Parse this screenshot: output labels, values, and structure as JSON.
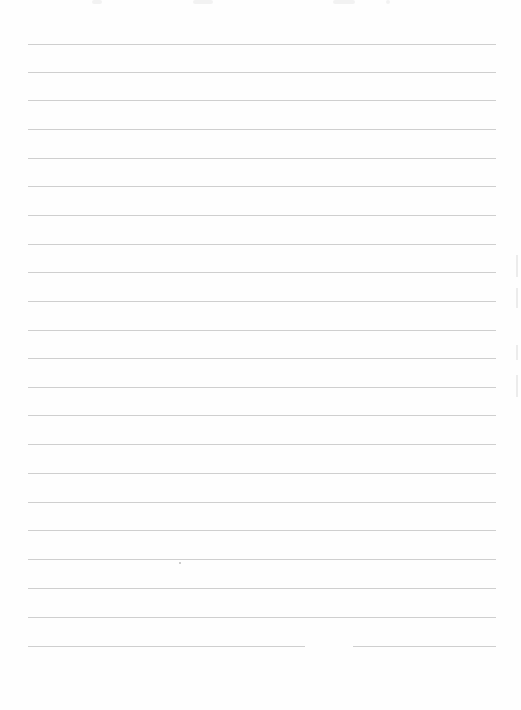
{
  "document": {
    "type": "lined-paper",
    "background_color": "#fefefe",
    "rule_color": "#cfcfcf",
    "rule_left_x": 28,
    "rule_right_x": 496,
    "rule_y_positions": [
      44,
      72,
      100,
      129,
      158,
      186,
      215,
      244,
      272,
      301,
      330,
      358,
      387,
      415,
      444,
      473,
      502,
      530,
      559,
      588,
      617,
      646
    ],
    "last_rule_gap": {
      "from_x": 305,
      "to_x": 353
    },
    "rule_count": 22
  }
}
